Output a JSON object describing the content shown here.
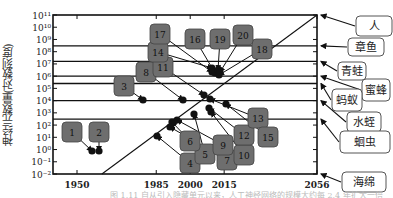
{
  "chart_data": {
    "type": "scatter",
    "title": "",
    "xlabel": "",
    "ylabel": "神经元数量(对数刻度)",
    "yscale": "log",
    "ylim": [
      0.01,
      100000000000
    ],
    "xlim": [
      1940,
      2056
    ],
    "x_ticks": [
      1950,
      1985,
      2000,
      2015,
      2056
    ],
    "y_ticks": [
      "10^-2",
      "10^-1",
      "10^0",
      "10^1",
      "10^2",
      "10^3",
      "10^4",
      "10^5",
      "10^6",
      "10^7",
      "10^8",
      "10^9",
      "10^10",
      "10^11"
    ],
    "grid": false,
    "legend_position": "right",
    "trend_line": {
      "from": [
        1961,
        0.01
      ],
      "to": [
        2056,
        100000000000
      ],
      "label": "extrapolated trend"
    },
    "reference_levels": [
      {
        "name": "人",
        "value": 100000000000
      },
      {
        "name": "章鱼",
        "value": 300000000
      },
      {
        "name": "青蛙",
        "value": 16000000
      },
      {
        "name": "蜜蜂",
        "value": 1000000
      },
      {
        "name": "蚂蚁",
        "value": 250000
      },
      {
        "name": "水蛭",
        "value": 10000
      },
      {
        "name": "蛔虫",
        "value": 302
      },
      {
        "name": "海绵",
        "value": 0.01
      }
    ],
    "points": [
      {
        "id": "1",
        "year": 1958,
        "value": 1
      },
      {
        "id": "2",
        "year": 1960,
        "value": 1
      },
      {
        "id": "3",
        "year": 1982,
        "value": 10000
      },
      {
        "id": "4",
        "year": 1986,
        "value": 15
      },
      {
        "id": "5",
        "year": 2001,
        "value": 400
      },
      {
        "id": "6",
        "year": 1993,
        "value": 60
      },
      {
        "id": "7",
        "year": 1995,
        "value": 250
      },
      {
        "id": "8",
        "year": 2001,
        "value": 10000
      },
      {
        "id": "9",
        "year": 1998,
        "value": 100
      },
      {
        "id": "10",
        "year": 2000,
        "value": 2000
      },
      {
        "id": "11",
        "year": 2008,
        "value": 60000
      },
      {
        "id": "12",
        "year": 2003,
        "value": 40000
      },
      {
        "id": "13",
        "year": 2008,
        "value": 10000
      },
      {
        "id": "14",
        "year": 2012,
        "value": 150000
      },
      {
        "id": "15",
        "year": 2009,
        "value": 20000
      },
      {
        "id": "16",
        "year": 2014,
        "value": 1500000
      },
      {
        "id": "17",
        "year": 2013,
        "value": 1000000
      },
      {
        "id": "18",
        "year": 2015,
        "value": 2000000
      },
      {
        "id": "19",
        "year": 2015,
        "value": 2000000
      },
      {
        "id": "20",
        "year": 2016,
        "value": 2500000
      }
    ]
  },
  "labels": {
    "ylabel": "神经元数量(对数刻度)",
    "caption": "图 1.11  自从引入隐藏单元以来，人工神经网络的规模大约每 2.4 年扩大一倍"
  }
}
